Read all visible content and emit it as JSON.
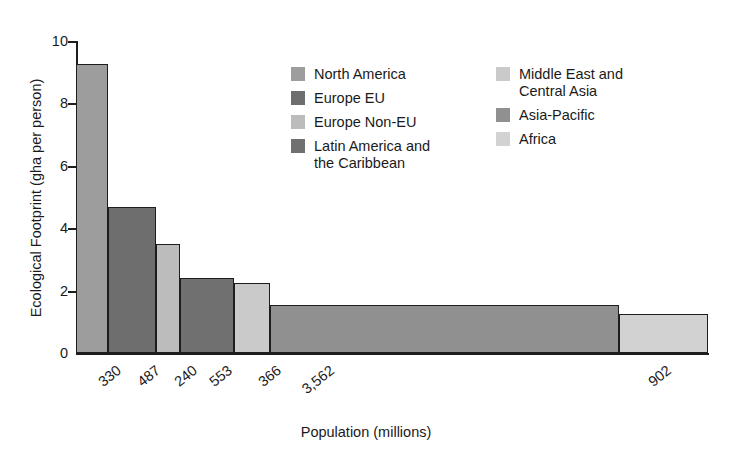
{
  "chart_data": {
    "type": "bar",
    "title": "",
    "xlabel": "Population (millions)",
    "ylabel": "Ecological Footprint (gha per person)",
    "ylim": [
      0,
      10
    ],
    "yticks": [
      "0",
      "2",
      "4",
      "6",
      "8",
      "10"
    ],
    "grid": false,
    "legend_position": "top-center",
    "note": "Variable-width bar chart: bar width is proportional to population, bar height is ecological footprint per person.",
    "categories": [
      "North America",
      "Europe EU",
      "Europe Non-EU",
      "Latin America and the Caribbean",
      "Middle East and Central Asia",
      "Asia-Pacific",
      "Africa"
    ],
    "xtick_labels": [
      "330",
      "487",
      "240",
      "553",
      "366",
      "3,562",
      "902"
    ],
    "populations": [
      330,
      487,
      240,
      553,
      366,
      3562,
      902
    ],
    "values": [
      9.25,
      4.68,
      3.5,
      2.4,
      2.25,
      1.55,
      1.25
    ],
    "bars": [
      {
        "label": "North America",
        "population": "330",
        "value": 9.25,
        "color": "#9d9d9d"
      },
      {
        "label": "Europe EU",
        "population": "487",
        "value": 4.68,
        "color": "#6e6e6e"
      },
      {
        "label": "Europe Non-EU",
        "population": "240",
        "value": 3.5,
        "color": "#bcbcbc"
      },
      {
        "label": "Latin America and the Caribbean",
        "population": "553",
        "value": 2.4,
        "color": "#707070"
      },
      {
        "label": "Middle East and Central Asia",
        "population": "366",
        "value": 2.25,
        "color": "#cacaca"
      },
      {
        "label": "Asia-Pacific",
        "population": "3,562",
        "value": 1.55,
        "color": "#909090"
      },
      {
        "label": "Africa",
        "population": "902",
        "value": 1.25,
        "color": "#d2d2d2"
      }
    ]
  },
  "legend": {
    "left_column": [
      {
        "label": "North America",
        "color": "#9d9d9d"
      },
      {
        "label": "Europe EU",
        "color": "#6e6e6e"
      },
      {
        "label": "Europe Non-EU",
        "color": "#bcbcbc"
      },
      {
        "label": "Latin America and\nthe Caribbean",
        "color": "#707070"
      }
    ],
    "right_column": [
      {
        "label": "Middle East and\nCentral Asia",
        "color": "#cacaca"
      },
      {
        "label": "Asia-Pacific",
        "color": "#909090"
      },
      {
        "label": "Africa",
        "color": "#d2d2d2"
      }
    ]
  },
  "axes": {
    "y_title": "Ecological Footprint (gha per person)",
    "x_title": "Population (millions)",
    "y_ticks": [
      "10",
      "8",
      "6",
      "4",
      "2",
      "0"
    ],
    "x_ticks": [
      "330",
      "487",
      "240",
      "553",
      "366",
      "3,562",
      "902"
    ]
  },
  "colors": {
    "axis": "#1d1d1d",
    "background": "#ffffff",
    "text": "#1a1a1a"
  }
}
